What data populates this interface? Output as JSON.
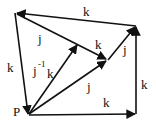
{
  "diagram": {
    "type": "directed-graph",
    "colors": {
      "stroke": "#111111",
      "background": "#ffffff"
    },
    "nodes": [
      {
        "id": "A",
        "x": 16,
        "y": 13,
        "label": ""
      },
      {
        "id": "B",
        "x": 136,
        "y": 26,
        "label": ""
      },
      {
        "id": "P",
        "x": 28,
        "y": 115,
        "label": "P"
      },
      {
        "id": "C",
        "x": 136,
        "y": 113,
        "label": ""
      },
      {
        "id": "M",
        "x": 77,
        "y": 44,
        "label": ""
      },
      {
        "id": "N",
        "x": 107,
        "y": 60,
        "label": ""
      }
    ],
    "edges": [
      {
        "from": "B",
        "to": "A",
        "label": "k"
      },
      {
        "from": "A",
        "to": "P",
        "label": "k"
      },
      {
        "from": "A",
        "to": "N",
        "label": "j"
      },
      {
        "from": "P",
        "to": "M",
        "label": "j⁻¹k"
      },
      {
        "from": "M",
        "to": "N",
        "label": "k"
      },
      {
        "from": "P",
        "to": "N",
        "label": "j"
      },
      {
        "from": "N",
        "to": "B",
        "label": "j"
      },
      {
        "from": "P",
        "to": "C",
        "label": "k"
      },
      {
        "from": "C",
        "to": "B",
        "label": "k"
      }
    ],
    "labels": {
      "p": "P",
      "top_k": "k",
      "left_k": "k",
      "upper_j": "j",
      "jinv_j": "j",
      "jinv_sup": "-1",
      "jinv_k": "k",
      "mid_k": "k",
      "right_j": "j",
      "lower_j": "j",
      "bottom_k": "k",
      "right_k": "k"
    }
  }
}
